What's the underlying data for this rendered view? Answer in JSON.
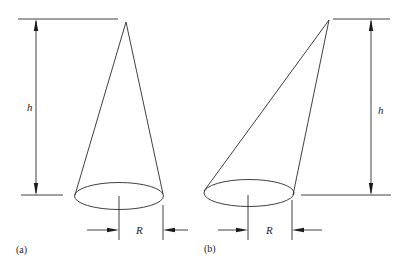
{
  "figure": {
    "panels": [
      {
        "id": "a",
        "caption": "(a)",
        "shape": "right circular cone",
        "height_label": "h",
        "radius_label": "R"
      },
      {
        "id": "b",
        "caption": "(b)",
        "shape": "oblique circular cone",
        "height_label": "h",
        "radius_label": "R"
      }
    ],
    "colors": {
      "line": "#2a2a2a",
      "background": "#ffffff"
    }
  }
}
